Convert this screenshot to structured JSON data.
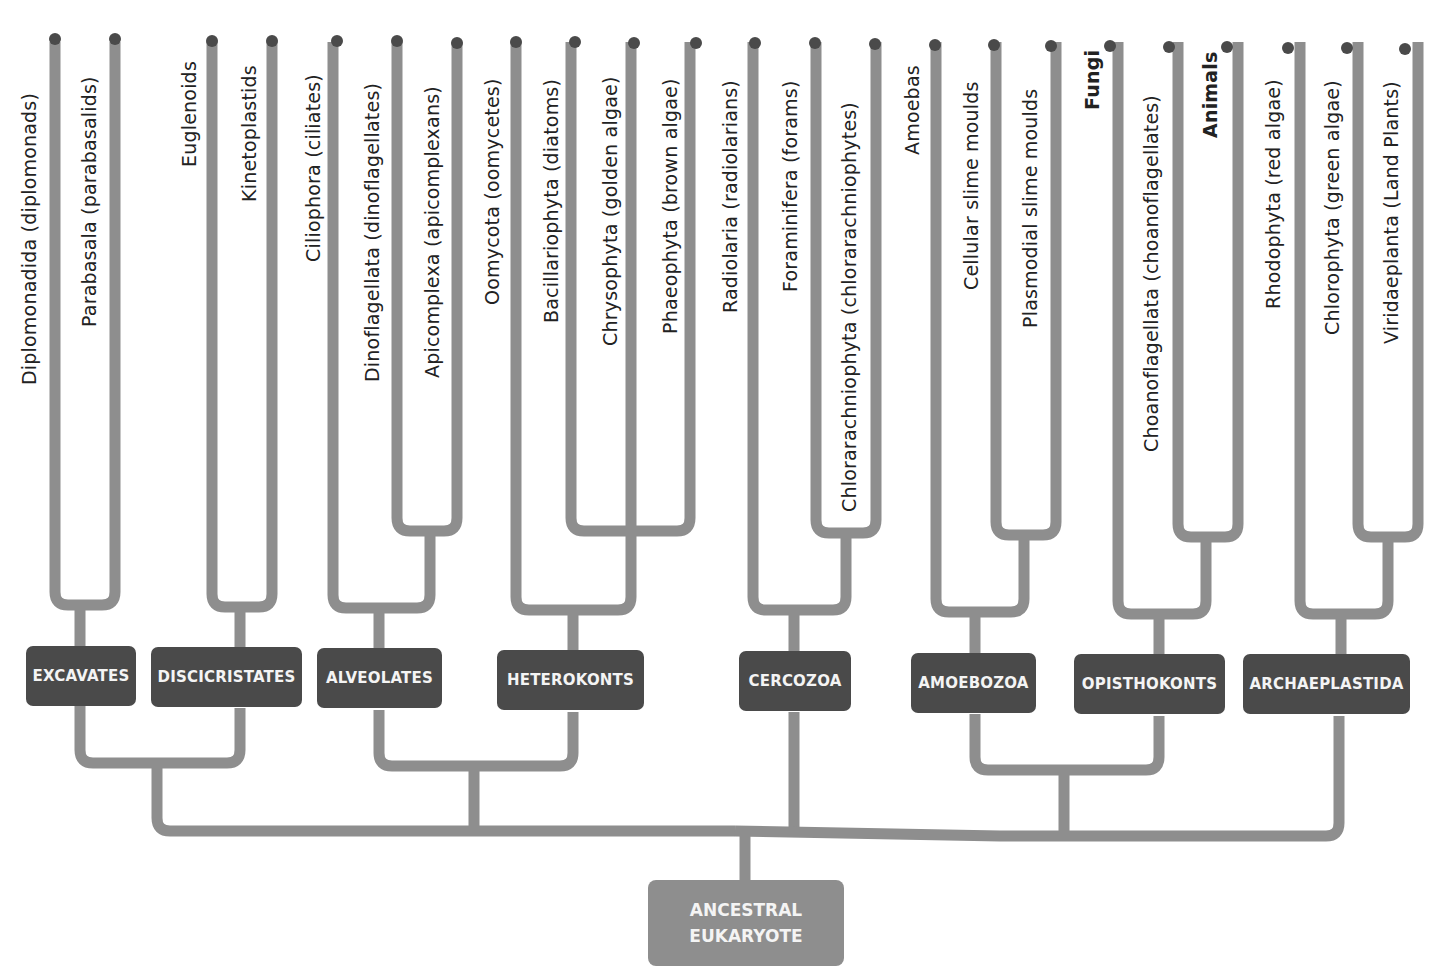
{
  "diagram": {
    "type": "phylogenetic-tree",
    "root": {
      "line1": "ANCESTRAL",
      "line2": "EUKARYOTE"
    },
    "colors": {
      "branch": "#8e8e8e",
      "clade_box": "#4a4a4a",
      "root_box": "#8e8e8e",
      "tip_dot": "#4a4a4a",
      "text_on_box": "#f4f4f4"
    },
    "taxa": [
      {
        "label": "Diplomonadida (diplomonads)",
        "bold": false
      },
      {
        "label": "Parabasala (parabasalids)",
        "bold": false
      },
      {
        "label": "Euglenoids",
        "bold": false
      },
      {
        "label": "Kinetoplastids",
        "bold": false
      },
      {
        "label": "Ciliophora (ciliates)",
        "bold": false
      },
      {
        "label": "Dinoflagellata (dinoflagellates)",
        "bold": false
      },
      {
        "label": "Apicomplexa (apicomplexans)",
        "bold": false
      },
      {
        "label": "Oomycota (oomycetes)",
        "bold": false
      },
      {
        "label": "Bacillariophyta (diatoms)",
        "bold": false
      },
      {
        "label": "Chrysophyta (golden algae)",
        "bold": false
      },
      {
        "label": "Phaeophyta (brown algae)",
        "bold": false
      },
      {
        "label": "Radiolaria (radiolarians)",
        "bold": false
      },
      {
        "label": "Foraminifera (forams)",
        "bold": false
      },
      {
        "label": "Chlorarachniophyta (chlorarachniophytes)",
        "bold": false
      },
      {
        "label": "Amoebas",
        "bold": false
      },
      {
        "label": "Cellular slime moulds",
        "bold": false
      },
      {
        "label": "Plasmodial slime moulds",
        "bold": false
      },
      {
        "label": "Fungi",
        "bold": true
      },
      {
        "label": "Choanoflagellata (choanoflagellates)",
        "bold": false
      },
      {
        "label": "Animals",
        "bold": true
      },
      {
        "label": "Rhodophyta (red algae)",
        "bold": false
      },
      {
        "label": "Chlorophyta (green algae)",
        "bold": false
      },
      {
        "label": "Viridaeplanta (Land Plants)",
        "bold": false
      }
    ],
    "clades": [
      {
        "label": "EXCAVATES"
      },
      {
        "label": "DISCICRISTATES"
      },
      {
        "label": "ALVEOLATES"
      },
      {
        "label": "HETEROKONTS"
      },
      {
        "label": "CERCOZOA"
      },
      {
        "label": "AMOEBOZOA"
      },
      {
        "label": "OPISTHOKONTS"
      },
      {
        "label": "ARCHAEPLASTIDA"
      }
    ]
  }
}
